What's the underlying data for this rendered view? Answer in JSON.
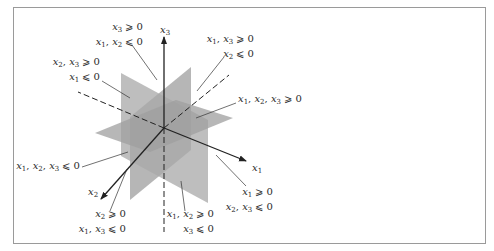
{
  "figure": {
    "axes": {
      "x1": "x1",
      "x2": "x2",
      "x3": "x3"
    },
    "octant_labels": [
      {
        "id": "top-back-left",
        "line1": "x3 ≥ 0",
        "line2": "x1, x2 ≤ 0"
      },
      {
        "id": "top-left",
        "line1": "x2, x3 ≥ 0",
        "line2": "x1 ≤ 0"
      },
      {
        "id": "top-right",
        "line1": "x1, x3 ≥ 0",
        "line2": "x2 ≤ 0"
      },
      {
        "id": "top-front",
        "line1": "x1, x2, x3 ≥ 0",
        "line2": ""
      },
      {
        "id": "bottom-back",
        "line1": "x1, x2, x3 ≤ 0",
        "line2": ""
      },
      {
        "id": "bottom-right",
        "line1": "x1 ≥ 0",
        "line2": "x2, x3 ≤ 0"
      },
      {
        "id": "bottom-left",
        "line1": "x2 ≥ 0",
        "line2": "x1, x3 ≤ 0"
      },
      {
        "id": "bottom-front",
        "line1": "x1, x2 ≥ 0",
        "line2": "x3 ≤ 0"
      }
    ],
    "colors": {
      "plane_fill": "#a8a8a8",
      "plane_dark": "#9c9c9c",
      "axis": "#222222",
      "frame": "#9a9a9a",
      "text": "#2a2a2a"
    }
  }
}
